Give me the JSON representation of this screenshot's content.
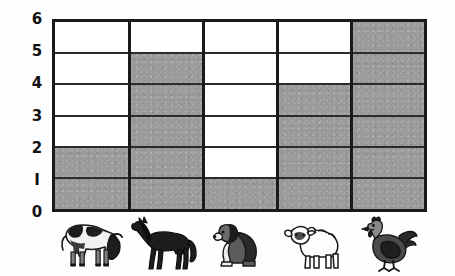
{
  "chart_data": {
    "type": "bar",
    "title": "",
    "subtitle": "",
    "xlabel": "",
    "ylabel": "",
    "categories": [
      "cow",
      "horse",
      "dog",
      "sheep",
      "chicken"
    ],
    "category_icons": [
      "cow-icon",
      "horse-icon",
      "dog-icon",
      "sheep-icon",
      "chicken-icon"
    ],
    "values": [
      2,
      5,
      1,
      4,
      6
    ],
    "ylim": [
      0,
      6
    ],
    "ytick_labels": [
      "0",
      "I",
      "2",
      "3",
      "4",
      "5",
      "6"
    ],
    "ytick_values": [
      0,
      1,
      2,
      3,
      4,
      5,
      6
    ],
    "grid": "horizontal-and-vertical",
    "legend": "none",
    "bar_fill_color": "#9a9a9a",
    "grid_color": "#2b2b2b",
    "axis_color": "#1a1a1a",
    "background_color": "#ffffff",
    "annotations": []
  },
  "axis": {
    "y_ticks": [
      {
        "label": "6",
        "value": 6
      },
      {
        "label": "5",
        "value": 5
      },
      {
        "label": "4",
        "value": 4
      },
      {
        "label": "3",
        "value": 3
      },
      {
        "label": "2",
        "value": 2
      },
      {
        "label": "I",
        "value": 1
      },
      {
        "label": "0",
        "value": 0
      }
    ]
  },
  "columns": [
    {
      "name": "cow",
      "icon": "cow-icon",
      "value": 2
    },
    {
      "name": "horse",
      "icon": "horse-icon",
      "value": 5
    },
    {
      "name": "dog",
      "icon": "dog-icon",
      "value": 1
    },
    {
      "name": "sheep",
      "icon": "sheep-icon",
      "value": 4
    },
    {
      "name": "chicken",
      "icon": "chicken-icon",
      "value": 6
    }
  ]
}
